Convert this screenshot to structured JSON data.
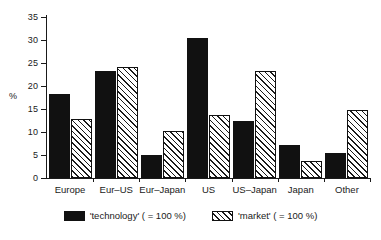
{
  "chart_data": {
    "type": "bar",
    "title": "",
    "xlabel": "",
    "ylabel": "%",
    "ylim": [
      0,
      35
    ],
    "yticks": [
      0,
      5,
      10,
      15,
      20,
      25,
      30,
      35
    ],
    "ytick_labels": [
      "0",
      "5",
      "10",
      "15",
      "20",
      "25",
      "30",
      "35"
    ],
    "grid": false,
    "legend_position": "bottom",
    "categories": [
      "Europe",
      "Eur–US",
      "Eur–Japan",
      "US",
      "US–Japan",
      "Japan",
      "Other"
    ],
    "series": [
      {
        "name": "'technology' ( = 100 %)",
        "key": "technology",
        "color": "#111111",
        "fill": "solid-black",
        "values": [
          18.2,
          23.2,
          5.0,
          30.5,
          12.3,
          7.2,
          5.5
        ]
      },
      {
        "name": "'market' ( = 100 %)",
        "key": "market",
        "color": "#ffffff",
        "fill": "diagonal-hatch",
        "values": [
          12.8,
          24.1,
          10.3,
          13.7,
          23.3,
          3.8,
          14.8
        ]
      }
    ]
  },
  "legend": {
    "entries": [
      {
        "label": "'technology' ( = 100 %)",
        "swatch": "solid-black-swatch"
      },
      {
        "label": "'market' ( = 100 %)",
        "swatch": "hatched-swatch"
      }
    ]
  },
  "axes": {
    "y_title": "%"
  }
}
